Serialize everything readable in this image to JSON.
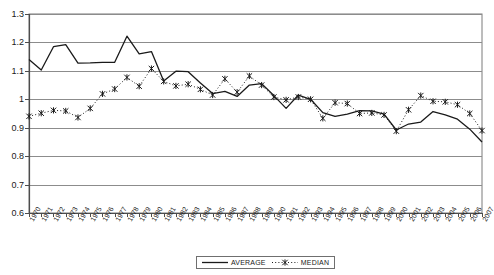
{
  "chart_data": {
    "type": "line",
    "title": "",
    "subtitle": "",
    "xlabel": "",
    "ylabel": "",
    "xlim": [
      1970,
      2007
    ],
    "ylim": [
      0.6,
      1.3
    ],
    "ytick_step": 0.1,
    "grid": "horizontal",
    "legend_position": "bottom-center",
    "x": [
      1970,
      1971,
      1972,
      1973,
      1974,
      1975,
      1976,
      1977,
      1978,
      1979,
      1980,
      1981,
      1982,
      1983,
      1984,
      1985,
      1986,
      1987,
      1988,
      1989,
      1990,
      1991,
      1992,
      1993,
      1994,
      1995,
      1996,
      1997,
      1998,
      1999,
      2000,
      2001,
      2002,
      2003,
      2004,
      2005,
      2006,
      2007
    ],
    "categories": [
      "1970",
      "1971",
      "1972",
      "1973",
      "1974",
      "1975",
      "1976",
      "1977",
      "1978",
      "1979",
      "1980",
      "1981",
      "1982",
      "1983",
      "1984",
      "1985",
      "1986",
      "1987",
      "1988",
      "1989",
      "1990",
      "1991",
      "1992",
      "1993",
      "1994",
      "1995",
      "1996",
      "1997",
      "1998",
      "1999",
      "2000",
      "2001",
      "2002",
      "2003",
      "2004",
      "2005",
      "2006",
      "2007"
    ],
    "yticks": [
      "0.6",
      "0.7",
      "0.8",
      "0.9",
      "1",
      "1.1",
      "1.2",
      "1.3"
    ],
    "series": [
      {
        "name": "AVERAGE",
        "style": "solid",
        "marker": "none",
        "color": "#1a1a1a",
        "values": [
          1.14,
          1.103,
          1.185,
          1.192,
          1.127,
          1.128,
          1.13,
          1.13,
          1.222,
          1.16,
          1.168,
          1.064,
          1.099,
          1.097,
          1.057,
          1.02,
          1.028,
          1.01,
          1.05,
          1.055,
          1.013,
          0.968,
          1.015,
          1.0,
          0.953,
          0.94,
          0.948,
          0.96,
          0.959,
          0.948,
          0.892,
          0.913,
          0.92,
          0.957,
          0.945,
          0.93,
          0.895,
          0.85
        ]
      },
      {
        "name": "MEDIAN",
        "style": "dotted",
        "marker": "x-star",
        "color": "#1a1a1a",
        "values": [
          0.94,
          0.951,
          0.961,
          0.959,
          0.936,
          0.968,
          1.019,
          1.036,
          1.077,
          1.046,
          1.108,
          1.063,
          1.047,
          1.053,
          1.035,
          1.015,
          1.072,
          1.025,
          1.082,
          1.05,
          1.008,
          0.998,
          1.008,
          1.0,
          0.933,
          0.988,
          0.985,
          0.95,
          0.952,
          0.945,
          0.888,
          0.963,
          1.013,
          0.993,
          0.991,
          0.981,
          0.95,
          0.89
        ]
      }
    ],
    "legend": [
      {
        "label": "AVERAGE",
        "style": "solid",
        "marker": "none"
      },
      {
        "label": "MEDIAN",
        "style": "dotted",
        "marker": "x-star"
      }
    ]
  }
}
